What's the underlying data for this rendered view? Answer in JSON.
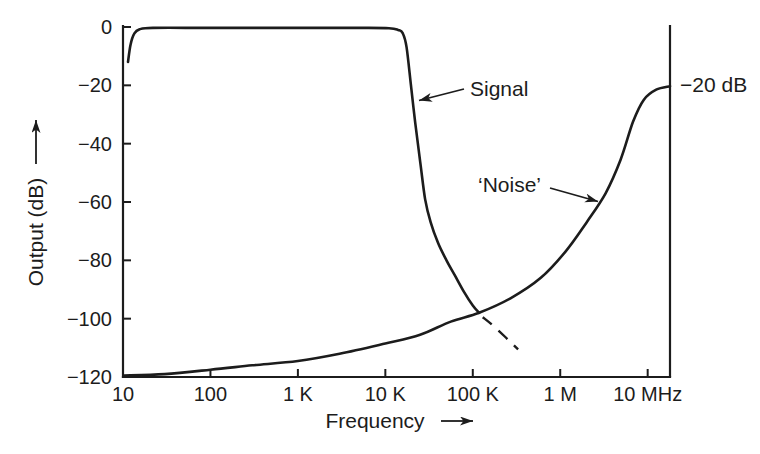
{
  "figure": {
    "ink_color": "#1c1c1c",
    "background_color": "#ffffff"
  },
  "chart_data": {
    "type": "line",
    "title": "",
    "xlabel": "Frequency",
    "ylabel": "Output (dB)",
    "x_scale": "log",
    "x_unit": "Hz",
    "x_range_hz": [
      10,
      18000000
    ],
    "y_range_db": [
      -120,
      0
    ],
    "grid": false,
    "legend_position": "none",
    "x_ticks": [
      {
        "value": 10,
        "label": "10"
      },
      {
        "value": 100,
        "label": "100"
      },
      {
        "value": 1000,
        "label": "1 K"
      },
      {
        "value": 10000,
        "label": "10 K"
      },
      {
        "value": 100000,
        "label": "100 K"
      },
      {
        "value": 1000000,
        "label": "1 M"
      },
      {
        "value": 10000000,
        "label": "10 MHz"
      }
    ],
    "y_ticks": [
      {
        "value": 0,
        "label": "0"
      },
      {
        "value": -20,
        "label": "−20"
      },
      {
        "value": -40,
        "label": "−40"
      },
      {
        "value": -60,
        "label": "−60"
      },
      {
        "value": -80,
        "label": "−80"
      },
      {
        "value": -100,
        "label": "−100"
      },
      {
        "value": -120,
        "label": "−120"
      }
    ],
    "annotations": {
      "signal_label": "Signal",
      "noise_label": "‘Noise’",
      "right_value_label": "−20 dB"
    },
    "series": [
      {
        "key": "signal",
        "name": "Signal",
        "style": "solid",
        "points": [
          [
            11.4,
            -12
          ],
          [
            12.2,
            -6
          ],
          [
            13.5,
            -2.2
          ],
          [
            15.5,
            -0.8
          ],
          [
            22,
            -0.3
          ],
          [
            100,
            -0.3
          ],
          [
            1000,
            -0.3
          ],
          [
            5000,
            -0.3
          ],
          [
            11000,
            -0.4
          ],
          [
            14000,
            -1
          ],
          [
            15800,
            -2.1
          ],
          [
            17500,
            -7
          ],
          [
            19800,
            -21
          ],
          [
            22000,
            -33
          ],
          [
            25000,
            -46
          ],
          [
            28500,
            -59
          ],
          [
            33000,
            -67
          ],
          [
            40000,
            -74
          ],
          [
            50000,
            -80
          ],
          [
            62000,
            -85
          ],
          [
            80000,
            -91
          ],
          [
            100000,
            -95.5
          ],
          [
            118000,
            -98
          ]
        ]
      },
      {
        "key": "signal_dashed",
        "name": "Signal (dashed extrapolation)",
        "style": "dashed",
        "points": [
          [
            130000,
            -99.5
          ],
          [
            180000,
            -103
          ],
          [
            330000,
            -110.5
          ]
        ]
      },
      {
        "key": "noise",
        "name": "Noise",
        "style": "solid",
        "points": [
          [
            10.3,
            -119.5
          ],
          [
            30,
            -119
          ],
          [
            100,
            -117.5
          ],
          [
            300,
            -116
          ],
          [
            1000,
            -114.5
          ],
          [
            3000,
            -112
          ],
          [
            10000,
            -108.5
          ],
          [
            25000,
            -105.5
          ],
          [
            56000,
            -101
          ],
          [
            118000,
            -98
          ],
          [
            270000,
            -93
          ],
          [
            600000,
            -86
          ],
          [
            1150000,
            -77
          ],
          [
            2000000,
            -67
          ],
          [
            3300000,
            -57
          ],
          [
            4900000,
            -45.5
          ],
          [
            6800000,
            -32.5
          ],
          [
            9000000,
            -25
          ],
          [
            12500000,
            -21.5
          ],
          [
            18000000,
            -20.3
          ]
        ]
      }
    ]
  }
}
